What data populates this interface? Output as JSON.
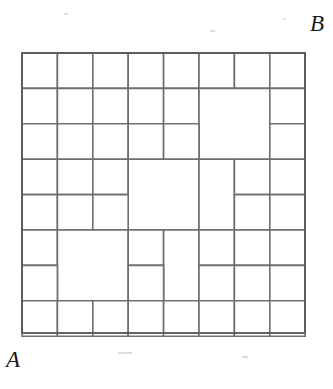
{
  "figure": {
    "kind": "squared-square-dissection",
    "caption_labels": {
      "top_right": "B",
      "bottom_left": "A"
    },
    "colors": {
      "line": "#6e6e72",
      "frame": "#5c5c60",
      "fill": "#ffffff",
      "background": "#ffffff",
      "label": "#1a1a1a"
    },
    "geometry": {
      "origin_x": 22,
      "origin_y": 53,
      "unit": 35.4,
      "columns": 8,
      "rows": 8,
      "width": 283,
      "height": 280
    },
    "tiles": [
      {
        "id": "t01",
        "col": 0,
        "row": 0,
        "w": 1,
        "h": 1
      },
      {
        "id": "t02",
        "col": 1,
        "row": 0,
        "w": 1,
        "h": 1
      },
      {
        "id": "t03",
        "col": 2,
        "row": 0,
        "w": 1,
        "h": 1
      },
      {
        "id": "t04",
        "col": 3,
        "row": 0,
        "w": 1,
        "h": 1
      },
      {
        "id": "t05",
        "col": 4,
        "row": 0,
        "w": 1,
        "h": 1
      },
      {
        "id": "t06",
        "col": 5,
        "row": 0,
        "w": 1,
        "h": 1
      },
      {
        "id": "t07",
        "col": 6,
        "row": 0,
        "w": 1,
        "h": 1
      },
      {
        "id": "t08",
        "col": 7,
        "row": 0,
        "w": 1,
        "h": 1
      },
      {
        "id": "t09",
        "col": 0,
        "row": 1,
        "w": 1,
        "h": 1
      },
      {
        "id": "t10",
        "col": 1,
        "row": 1,
        "w": 1,
        "h": 1
      },
      {
        "id": "t11",
        "col": 2,
        "row": 1,
        "w": 1,
        "h": 1
      },
      {
        "id": "t12",
        "col": 3,
        "row": 1,
        "w": 1,
        "h": 1
      },
      {
        "id": "t13",
        "col": 4,
        "row": 1,
        "w": 1,
        "h": 1
      },
      {
        "id": "t14",
        "col": 5,
        "row": 1,
        "w": 2,
        "h": 2
      },
      {
        "id": "t15",
        "col": 7,
        "row": 1,
        "w": 1,
        "h": 1
      },
      {
        "id": "t16",
        "col": 0,
        "row": 2,
        "w": 1,
        "h": 1
      },
      {
        "id": "t17",
        "col": 1,
        "row": 2,
        "w": 1,
        "h": 1
      },
      {
        "id": "t18",
        "col": 2,
        "row": 2,
        "w": 1,
        "h": 1
      },
      {
        "id": "t19",
        "col": 3,
        "row": 2,
        "w": 1,
        "h": 1
      },
      {
        "id": "t20",
        "col": 4,
        "row": 2,
        "w": 1,
        "h": 1
      },
      {
        "id": "t21",
        "col": 7,
        "row": 2,
        "w": 1,
        "h": 1
      },
      {
        "id": "t22",
        "col": 0,
        "row": 3,
        "w": 1,
        "h": 1
      },
      {
        "id": "t23",
        "col": 1,
        "row": 3,
        "w": 1,
        "h": 1
      },
      {
        "id": "t24",
        "col": 2,
        "row": 3,
        "w": 1,
        "h": 1
      },
      {
        "id": "t25",
        "col": 3,
        "row": 3,
        "w": 2,
        "h": 2
      },
      {
        "id": "t26",
        "col": 5,
        "row": 3,
        "w": 1,
        "h": 2
      },
      {
        "id": "t27",
        "col": 6,
        "row": 3,
        "w": 1,
        "h": 1
      },
      {
        "id": "t28",
        "col": 7,
        "row": 3,
        "w": 1,
        "h": 1
      },
      {
        "id": "t29",
        "col": 0,
        "row": 4,
        "w": 1,
        "h": 1
      },
      {
        "id": "t30",
        "col": 1,
        "row": 4,
        "w": 1,
        "h": 1
      },
      {
        "id": "t31",
        "col": 2,
        "row": 4,
        "w": 1,
        "h": 1
      },
      {
        "id": "t32",
        "col": 6,
        "row": 4,
        "w": 1,
        "h": 1
      },
      {
        "id": "t33",
        "col": 7,
        "row": 4,
        "w": 1,
        "h": 1
      },
      {
        "id": "t34",
        "col": 0,
        "row": 5,
        "w": 1,
        "h": 1
      },
      {
        "id": "t35",
        "col": 1,
        "row": 5,
        "w": 2,
        "h": 2
      },
      {
        "id": "t36",
        "col": 3,
        "row": 5,
        "w": 1,
        "h": 1
      },
      {
        "id": "t37",
        "col": 4,
        "row": 5,
        "w": 1,
        "h": 2
      },
      {
        "id": "t38",
        "col": 5,
        "row": 5,
        "w": 1,
        "h": 1
      },
      {
        "id": "t39",
        "col": 6,
        "row": 5,
        "w": 1,
        "h": 1
      },
      {
        "id": "t40",
        "col": 7,
        "row": 5,
        "w": 1,
        "h": 1
      },
      {
        "id": "t41",
        "col": 0,
        "row": 6,
        "w": 1,
        "h": 1
      },
      {
        "id": "t42",
        "col": 3,
        "row": 6,
        "w": 1,
        "h": 1
      },
      {
        "id": "t43",
        "col": 5,
        "row": 6,
        "w": 1,
        "h": 1
      },
      {
        "id": "t44",
        "col": 6,
        "row": 6,
        "w": 1,
        "h": 1
      },
      {
        "id": "t45",
        "col": 7,
        "row": 6,
        "w": 1,
        "h": 1
      },
      {
        "id": "t46",
        "col": 0,
        "row": 7,
        "w": 1,
        "h": 1
      },
      {
        "id": "t47",
        "col": 1,
        "row": 7,
        "w": 1,
        "h": 1
      },
      {
        "id": "t48",
        "col": 2,
        "row": 7,
        "w": 1,
        "h": 1
      },
      {
        "id": "t49",
        "col": 3,
        "row": 7,
        "w": 1,
        "h": 1
      },
      {
        "id": "t50",
        "col": 4,
        "row": 7,
        "w": 1,
        "h": 1
      },
      {
        "id": "t51",
        "col": 5,
        "row": 7,
        "w": 1,
        "h": 1
      },
      {
        "id": "t52",
        "col": 6,
        "row": 7,
        "w": 1,
        "h": 1
      },
      {
        "id": "t53",
        "col": 7,
        "row": 7,
        "w": 1,
        "h": 1
      }
    ]
  }
}
